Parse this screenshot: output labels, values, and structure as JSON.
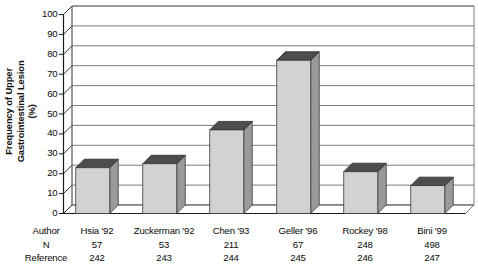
{
  "chart_data": {
    "type": "bar",
    "title": "",
    "xlabel": "",
    "ylabel": "Frequency of Upper Gastrointestinal Lesion (%)",
    "ylabel_lines": [
      "Frequency of Upper",
      "Gastrointestinal Lesion",
      "(%)"
    ],
    "categories": [
      "Hsia '92",
      "Zuckerman '92",
      "Chen '93",
      "Geller '96",
      "Rockey '98",
      "Bini '99"
    ],
    "values": [
      23,
      25,
      42,
      77,
      21,
      14
    ],
    "ylim": [
      0,
      100
    ],
    "yticks": [
      0,
      10,
      20,
      30,
      40,
      50,
      60,
      70,
      80,
      90,
      100
    ],
    "ytick_labels": [
      "0",
      "10",
      "20",
      "30",
      "40",
      "50",
      "60",
      "70",
      "80",
      "90",
      "100"
    ],
    "grid": true,
    "legend": "none",
    "style": "3d-column",
    "row_labels": [
      "Author",
      "N",
      "Reference"
    ],
    "rows": {
      "author": [
        "Hsia '92",
        "Zuckerman '92",
        "Chen '93",
        "Geller '96",
        "Rockey '98",
        "Bini '99"
      ],
      "n": [
        "57",
        "53",
        "211",
        "67",
        "248",
        "498"
      ],
      "reference": [
        "242",
        "243",
        "244",
        "245",
        "246",
        "247"
      ]
    },
    "colors": {
      "bar_front": "#d2d2d2",
      "bar_top": "#4d4d4d",
      "bar_side": "#9a9a9a",
      "floor": "#ffffff",
      "gridline": "#6e6e6e",
      "axis": "#1a1a1a",
      "background": "#ffffff",
      "text": "#0a0a0a"
    }
  }
}
